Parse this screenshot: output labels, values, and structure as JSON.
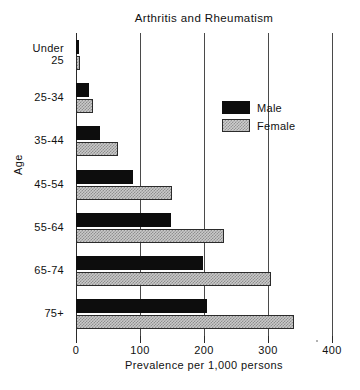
{
  "chart_data": {
    "type": "bar",
    "orientation": "horizontal",
    "title": "Arthritis and Rheumatism",
    "xlabel": "Prevalence per 1,000 persons",
    "ylabel": "Age",
    "categories": [
      "Under\n25",
      "25-34",
      "35-44",
      "45-54",
      "55-64",
      "65-74",
      "75+"
    ],
    "xlim": [
      0,
      400
    ],
    "xticks": [
      0,
      100,
      200,
      300,
      400
    ],
    "xtick_labels": [
      "0",
      "100",
      "200",
      "300",
      "400"
    ],
    "grid": true,
    "grid_axis": "x",
    "legend_position": "upper right inside",
    "series": [
      {
        "name": "Male",
        "color": "#0d0d0d",
        "values": [
          4,
          20,
          38,
          89,
          148,
          198,
          205
        ]
      },
      {
        "name": "Female",
        "color": "#c9c9c9",
        "values": [
          6,
          27,
          65,
          150,
          232,
          305,
          340
        ]
      }
    ]
  },
  "legend": {
    "entries": [
      {
        "label": "Male",
        "swatch": "male-swatch"
      },
      {
        "label": "Female",
        "swatch": "female-swatch"
      }
    ]
  }
}
